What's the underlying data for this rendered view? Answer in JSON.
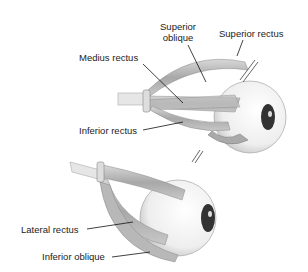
{
  "figure": {
    "top_eye": {
      "labels": {
        "superior_oblique_1": "Superior",
        "superior_oblique_2": "oblique",
        "superior_rectus": "Superior rectus",
        "medius_rectus": "Medius rectus",
        "inferior_rectus": "Inferior rectus"
      }
    },
    "bottom_eye": {
      "labels": {
        "lateral_rectus": "Lateral rectus",
        "inferior_oblique": "Inferior oblique"
      }
    }
  }
}
